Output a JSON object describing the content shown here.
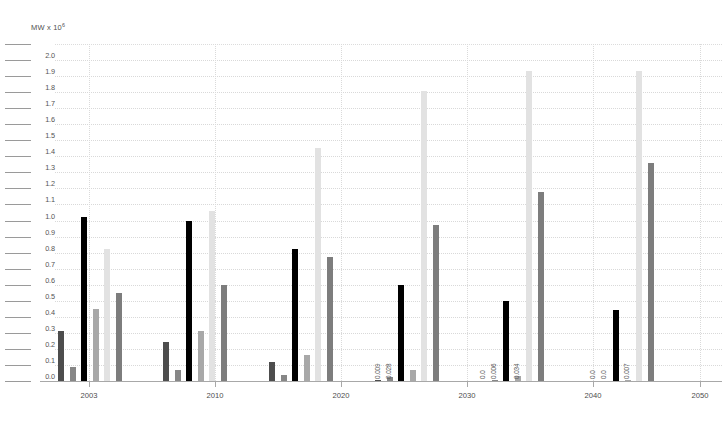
{
  "axis_caption": {
    "prefix": "MW x 10",
    "exponent": "6"
  },
  "chart_data": {
    "type": "bar",
    "title": "",
    "subtitle": "",
    "xlabel": "",
    "ylabel": "MW x 10^6",
    "ylim": [
      0.0,
      2.0
    ],
    "ytick_step": 0.1,
    "grid": true,
    "legend_position": "none",
    "categories": [
      "2003",
      "2010",
      "2020",
      "2030",
      "2040",
      "2055"
    ],
    "xtick_labels": [
      "2003",
      "2010",
      "2020",
      "2030",
      "2040",
      "2050"
    ],
    "ytick_labels": [
      "0.0",
      "0.1",
      "0.2",
      "0.3",
      "0.4",
      "0.5",
      "0.6",
      "0.7",
      "0.8",
      "0.9",
      "1.0",
      "1.1",
      "1.2",
      "1.3",
      "1.4",
      "1.5",
      "1.6",
      "1.7",
      "1.8",
      "1.9",
      "2.0"
    ],
    "series": [
      {
        "name": "Series 1",
        "color": "#4d4d4d",
        "values": [
          0.31,
          0.24,
          0.12,
          0.009,
          0.0,
          0.0
        ]
      },
      {
        "name": "Series 2",
        "color": "#878787",
        "values": [
          0.09,
          0.07,
          0.04,
          0.028,
          0.006,
          0.0
        ]
      },
      {
        "name": "Series 3",
        "color": "#000000",
        "values": [
          1.02,
          1.0,
          0.82,
          0.6,
          0.5,
          0.44
        ]
      },
      {
        "name": "Series 4",
        "color": "#a8a8a8",
        "values": [
          0.45,
          0.31,
          0.16,
          0.07,
          0.034,
          0.007
        ]
      },
      {
        "name": "Series 5",
        "color": "#e2e2e2",
        "values": [
          0.82,
          1.06,
          1.45,
          1.81,
          1.93,
          1.93
        ]
      },
      {
        "name": "Series 6",
        "color": "#7d7d7d",
        "values": [
          0.55,
          0.6,
          0.77,
          0.97,
          1.18,
          1.36
        ]
      }
    ],
    "value_annotations": [
      {
        "group": "2030",
        "series": 0,
        "text": "0.009"
      },
      {
        "group": "2030",
        "series": 1,
        "text": "0.028"
      },
      {
        "group": "2040",
        "series": 0,
        "text": "0.0"
      },
      {
        "group": "2040",
        "series": 1,
        "text": "0.006"
      },
      {
        "group": "2040",
        "series": 3,
        "text": "0.034"
      },
      {
        "group": "2055",
        "series": 0,
        "text": "0.0"
      },
      {
        "group": "2055",
        "series": 1,
        "text": "0.0"
      },
      {
        "group": "2055",
        "series": 3,
        "text": "0.007"
      }
    ]
  }
}
